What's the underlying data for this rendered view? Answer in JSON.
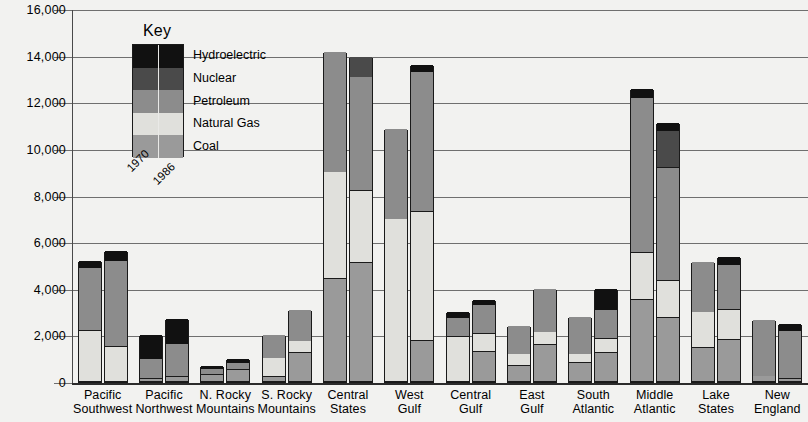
{
  "chart_data": {
    "type": "bar",
    "title": "",
    "xlabel": "",
    "ylabel": "",
    "ylim": [
      0,
      16000
    ],
    "ytick_labels": [
      "16,000",
      "14,000",
      "12,000",
      "10,000",
      "8,000",
      "6,000",
      "4,000",
      "2,000",
      "0"
    ],
    "ytick_values": [
      16000,
      14000,
      12000,
      10000,
      8000,
      6000,
      4000,
      2000,
      0
    ],
    "grid": true,
    "legend_position": "inside-top-left",
    "legend_title": "Key",
    "series_years": [
      "1970",
      "1986"
    ],
    "stack_order_bottom_to_top": [
      "Coal",
      "Natural Gas",
      "Petroleum",
      "Nuclear",
      "Hydroelectric"
    ],
    "series": [
      {
        "name": "Hydroelectric",
        "color": "#111111"
      },
      {
        "name": "Nuclear",
        "color": "#4a4a4a"
      },
      {
        "name": "Petroleum",
        "color": "#8c8c8c"
      },
      {
        "name": "Natural Gas",
        "color": "#e0e0dc"
      },
      {
        "name": "Coal",
        "color": "#9a9a9a"
      }
    ],
    "categories": [
      "Pacific Southwest",
      "Pacific Northwest",
      "N. Rocky Mountains",
      "S. Rocky Mountains",
      "Central States",
      "West Gulf",
      "Central Gulf",
      "East Gulf",
      "South Atlantic",
      "Middle Atlantic",
      "Lake States",
      "New England"
    ],
    "category_lines": [
      [
        "Pacific",
        "Southwest"
      ],
      [
        "Pacific",
        "Northwest"
      ],
      [
        "N. Rocky",
        "Mountains"
      ],
      [
        "S. Rocky",
        "Mountains"
      ],
      [
        "Central",
        "States"
      ],
      [
        "West",
        "Gulf"
      ],
      [
        "Central",
        "Gulf"
      ],
      [
        "East",
        "Gulf"
      ],
      [
        "South",
        "Atlantic"
      ],
      [
        "Middle",
        "Atlantic"
      ],
      [
        "Lake",
        "States"
      ],
      [
        "New",
        "England"
      ]
    ],
    "data": [
      {
        "category": "Pacific Southwest",
        "bars": [
          {
            "year": "1970",
            "total": 5200,
            "segments": {
              "Coal": 0,
              "Natural Gas": 2200,
              "Petroleum": 2700,
              "Nuclear": 0,
              "Hydroelectric": 300
            }
          },
          {
            "year": "1986",
            "total": 5600,
            "segments": {
              "Coal": 0,
              "Natural Gas": 1500,
              "Petroleum": 3700,
              "Nuclear": 0,
              "Hydroelectric": 400
            }
          }
        ]
      },
      {
        "category": "Pacific Northwest",
        "bars": [
          {
            "year": "1970",
            "total": 2000,
            "segments": {
              "Coal": 150,
              "Natural Gas": 0,
              "Petroleum": 850,
              "Nuclear": 0,
              "Hydroelectric": 1000
            }
          },
          {
            "year": "1986",
            "total": 2700,
            "segments": {
              "Coal": 200,
              "Natural Gas": 0,
              "Petroleum": 1450,
              "Nuclear": 0,
              "Hydroelectric": 1050
            }
          }
        ]
      },
      {
        "category": "N. Rocky Mountains",
        "bars": [
          {
            "year": "1970",
            "total": 700,
            "segments": {
              "Coal": 300,
              "Natural Gas": 0,
              "Petroleum": 250,
              "Nuclear": 0,
              "Hydroelectric": 150
            }
          },
          {
            "year": "1986",
            "total": 1000,
            "segments": {
              "Coal": 500,
              "Natural Gas": 0,
              "Petroleum": 300,
              "Nuclear": 0,
              "Hydroelectric": 200
            }
          }
        ]
      },
      {
        "category": "S. Rocky Mountains",
        "bars": [
          {
            "year": "1970",
            "total": 2000,
            "segments": {
              "Coal": 200,
              "Natural Gas": 850,
              "Petroleum": 950,
              "Nuclear": 0,
              "Hydroelectric": 0
            }
          },
          {
            "year": "1986",
            "total": 3100,
            "segments": {
              "Coal": 1250,
              "Natural Gas": 500,
              "Petroleum": 1350,
              "Nuclear": 0,
              "Hydroelectric": 0
            }
          }
        ]
      },
      {
        "category": "Central States",
        "bars": [
          {
            "year": "1970",
            "total": 14150,
            "segments": {
              "Coal": 4400,
              "Natural Gas": 4600,
              "Petroleum": 5150,
              "Nuclear": 0,
              "Hydroelectric": 0
            }
          },
          {
            "year": "1986",
            "total": 13950,
            "segments": {
              "Coal": 5100,
              "Natural Gas": 3100,
              "Petroleum": 4900,
              "Nuclear": 850,
              "Hydroelectric": 0
            }
          }
        ]
      },
      {
        "category": "West Gulf",
        "bars": [
          {
            "year": "1970",
            "total": 10850,
            "segments": {
              "Coal": 0,
              "Natural Gas": 7000,
              "Petroleum": 3850,
              "Nuclear": 0,
              "Hydroelectric": 0
            }
          },
          {
            "year": "1986",
            "total": 13600,
            "segments": {
              "Coal": 1750,
              "Natural Gas": 5550,
              "Petroleum": 6000,
              "Nuclear": 0,
              "Hydroelectric": 300
            }
          }
        ]
      },
      {
        "category": "Central Gulf",
        "bars": [
          {
            "year": "1970",
            "total": 3000,
            "segments": {
              "Coal": 0,
              "Natural Gas": 1950,
              "Petroleum": 800,
              "Nuclear": 0,
              "Hydroelectric": 250
            }
          },
          {
            "year": "1986",
            "total": 3500,
            "segments": {
              "Coal": 1300,
              "Natural Gas": 750,
              "Petroleum": 1250,
              "Nuclear": 0,
              "Hydroelectric": 200
            }
          }
        ]
      },
      {
        "category": "East Gulf",
        "bars": [
          {
            "year": "1970",
            "total": 2400,
            "segments": {
              "Coal": 700,
              "Natural Gas": 500,
              "Petroleum": 1200,
              "Nuclear": 0,
              "Hydroelectric": 0
            }
          },
          {
            "year": "1986",
            "total": 4000,
            "segments": {
              "Coal": 1600,
              "Natural Gas": 550,
              "Petroleum": 1850,
              "Nuclear": 0,
              "Hydroelectric": 0
            }
          }
        ]
      },
      {
        "category": "South Atlantic",
        "bars": [
          {
            "year": "1970",
            "total": 2800,
            "segments": {
              "Coal": 800,
              "Natural Gas": 400,
              "Petroleum": 1600,
              "Nuclear": 0,
              "Hydroelectric": 0
            }
          },
          {
            "year": "1986",
            "total": 4000,
            "segments": {
              "Coal": 1250,
              "Natural Gas": 600,
              "Petroleum": 1250,
              "Nuclear": 0,
              "Hydroelectric": 900
            }
          }
        ]
      },
      {
        "category": "Middle Atlantic",
        "bars": [
          {
            "year": "1970",
            "total": 12550,
            "segments": {
              "Coal": 3500,
              "Natural Gas": 2050,
              "Petroleum": 6650,
              "Nuclear": 0,
              "Hydroelectric": 350
            }
          },
          {
            "year": "1986",
            "total": 11100,
            "segments": {
              "Coal": 2750,
              "Natural Gas": 1600,
              "Petroleum": 4850,
              "Nuclear": 1550,
              "Hydroelectric": 350
            }
          }
        ]
      },
      {
        "category": "Lake States",
        "bars": [
          {
            "year": "1970",
            "total": 5150,
            "segments": {
              "Coal": 1450,
              "Natural Gas": 1550,
              "Petroleum": 2150,
              "Nuclear": 0,
              "Hydroelectric": 0
            }
          },
          {
            "year": "1986",
            "total": 5350,
            "segments": {
              "Coal": 1800,
              "Natural Gas": 1300,
              "Petroleum": 1900,
              "Nuclear": 0,
              "Hydroelectric": 350
            }
          }
        ]
      },
      {
        "category": "New England",
        "bars": [
          {
            "year": "1970",
            "total": 2650,
            "segments": {
              "Coal": 250,
              "Natural Gas": 0,
              "Petroleum": 2400,
              "Nuclear": 0,
              "Hydroelectric": 0
            }
          },
          {
            "year": "1986",
            "total": 2500,
            "segments": {
              "Coal": 150,
              "Natural Gas": 0,
              "Petroleum": 2050,
              "Nuclear": 0,
              "Hydroelectric": 300
            }
          }
        ]
      }
    ]
  }
}
